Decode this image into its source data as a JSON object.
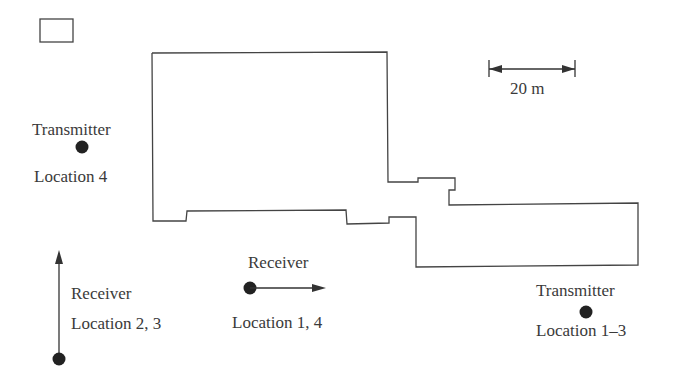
{
  "diagram": {
    "type": "floor-plan-measurement-layout",
    "legend_box": {
      "present": true
    },
    "scale_bar": {
      "label": "20 m"
    },
    "transmitters": [
      {
        "title": "Transmitter",
        "location_label": "Location 4"
      },
      {
        "title": "Transmitter",
        "location_label": "Location 1–3"
      }
    ],
    "receivers": [
      {
        "title": "Receiver",
        "location_label": "Location 2, 3",
        "orientation": "vertical-up"
      },
      {
        "title": "Receiver",
        "location_label": "Location 1, 4",
        "orientation": "horizontal-right"
      }
    ],
    "colors": {
      "stroke": "#3a3a3a",
      "marker": "#222222",
      "background": "#ffffff"
    }
  }
}
